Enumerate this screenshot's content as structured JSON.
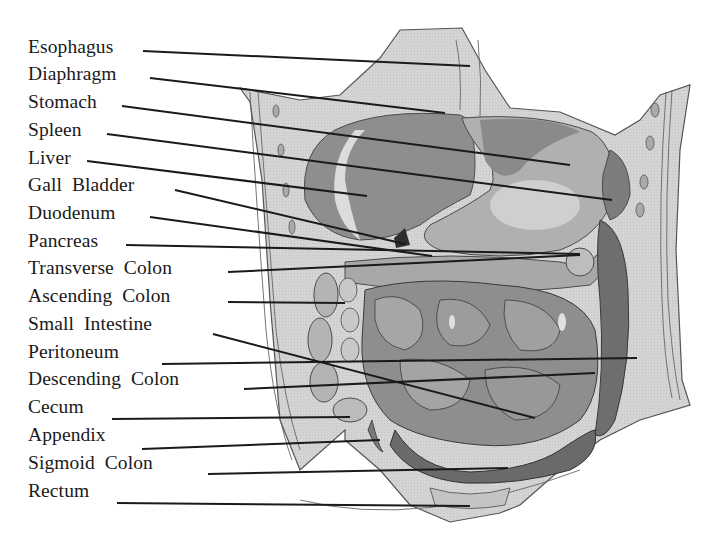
{
  "diagram": {
    "colors": {
      "background": "#ffffff",
      "body_wall": "#d4d4d4",
      "organ_dark": "#7a7a7a",
      "organ_mid": "#9c9c9c",
      "organ_light": "#bdbdbd",
      "highlight": "#e6e6e6",
      "outline": "#4a4a4a",
      "leader_line": "#1a1a1a",
      "text": "#1a1a1a"
    },
    "labels": [
      {
        "id": "esophagus",
        "text": "Esophagus",
        "x": 28,
        "y": 37,
        "line": [
          143,
          51,
          470,
          66
        ]
      },
      {
        "id": "diaphragm",
        "text": "Diaphragm",
        "x": 28,
        "y": 64,
        "line": [
          150,
          78,
          445,
          113
        ]
      },
      {
        "id": "stomach",
        "text": "Stomach",
        "x": 28,
        "y": 92,
        "line": [
          122,
          106,
          570,
          165
        ]
      },
      {
        "id": "spleen",
        "text": "Spleen",
        "x": 28,
        "y": 120,
        "line": [
          107,
          134,
          612,
          200
        ]
      },
      {
        "id": "liver",
        "text": "Liver",
        "x": 28,
        "y": 148,
        "line": [
          87,
          161,
          367,
          196
        ]
      },
      {
        "id": "gall-bladder",
        "text": "Gall  Bladder",
        "x": 28,
        "y": 175,
        "line": [
          175,
          190,
          405,
          244
        ]
      },
      {
        "id": "duodenum",
        "text": "Duodenum",
        "x": 28,
        "y": 203,
        "line": [
          150,
          217,
          432,
          256
        ]
      },
      {
        "id": "pancreas",
        "text": "Pancreas",
        "x": 28,
        "y": 231,
        "line": [
          126,
          245,
          580,
          254
        ]
      },
      {
        "id": "transverse-colon",
        "text": "Transverse  Colon",
        "x": 28,
        "y": 258,
        "line": [
          228,
          272,
          580,
          255
        ]
      },
      {
        "id": "ascending-colon",
        "text": "Ascending  Colon",
        "x": 28,
        "y": 286,
        "line": [
          228,
          302,
          345,
          303
        ]
      },
      {
        "id": "small-intestine",
        "text": "Small  Intestine",
        "x": 28,
        "y": 314,
        "line": [
          213,
          334,
          535,
          418
        ]
      },
      {
        "id": "peritoneum",
        "text": "Peritoneum",
        "x": 28,
        "y": 342,
        "line": [
          162,
          364,
          637,
          358
        ]
      },
      {
        "id": "descending-colon",
        "text": "Descending  Colon",
        "x": 28,
        "y": 369,
        "line": [
          244,
          389,
          595,
          373
        ]
      },
      {
        "id": "cecum",
        "text": "Cecum",
        "x": 28,
        "y": 397,
        "line": [
          112,
          419,
          350,
          417
        ]
      },
      {
        "id": "appendix",
        "text": "Appendix",
        "x": 28,
        "y": 425,
        "line": [
          142,
          449,
          380,
          440
        ]
      },
      {
        "id": "sigmoid-colon",
        "text": "Sigmoid  Colon",
        "x": 28,
        "y": 453,
        "line": [
          208,
          474,
          508,
          468
        ]
      },
      {
        "id": "rectum",
        "text": "Rectum",
        "x": 28,
        "y": 481,
        "line": [
          117,
          503,
          470,
          506
        ]
      }
    ]
  }
}
